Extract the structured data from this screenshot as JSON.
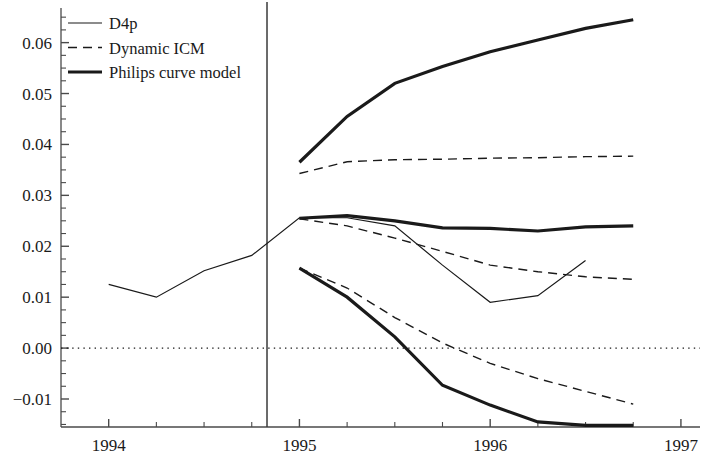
{
  "chart_data": {
    "type": "line",
    "title": "",
    "xlabel": "",
    "ylabel": "",
    "xlim": [
      1993.75,
      1997.1
    ],
    "ylim": [
      -0.0155,
      0.0668
    ],
    "yticks": [
      -0.01,
      0.0,
      0.01,
      0.02,
      0.03,
      0.04,
      0.05,
      0.06
    ],
    "ytick_labels": [
      "-0.01",
      "0.00",
      "0.01",
      "0.02",
      "0.03",
      "0.04",
      "0.05",
      "0.06"
    ],
    "y_minor_tick_step": 0.0025,
    "xticks": [
      1994,
      1995,
      1996,
      1997
    ],
    "xtick_labels": [
      "1994",
      "1995",
      "1996",
      "1997"
    ],
    "x_minor_tick_step": 0.25,
    "grid": false,
    "zero_line": {
      "value": 0.0,
      "style": "dotted"
    },
    "forecast_divider": {
      "x": 1994.83,
      "style": "solid",
      "label": ""
    },
    "legend": {
      "position": "top-left",
      "entries": [
        {
          "label": "D4p",
          "style": "solid",
          "width": 1.2
        },
        {
          "label": "Dynamic ICM",
          "style": "dashed",
          "width": 1.4
        },
        {
          "label": "Philips curve model",
          "style": "solid",
          "width": 3.2
        }
      ]
    },
    "series": [
      {
        "name": "D4p",
        "style": "solid",
        "width": 1.2,
        "x": [
          1994.0,
          1994.25,
          1994.5,
          1994.75,
          1995.0,
          1995.25,
          1995.5,
          1995.75,
          1996.0,
          1996.25,
          1996.5
        ],
        "values": [
          0.0125,
          0.01,
          0.0152,
          0.0182,
          0.0256,
          0.0256,
          0.024,
          0.0163,
          0.009,
          0.0103,
          0.0172
        ]
      },
      {
        "name": "Dynamic ICM (upper)",
        "style": "dashed",
        "width": 1.4,
        "x": [
          1995.0,
          1995.25,
          1995.5,
          1995.75,
          1996.0,
          1996.25,
          1996.5,
          1996.75
        ],
        "values": [
          0.0343,
          0.0366,
          0.037,
          0.0371,
          0.0373,
          0.0374,
          0.0376,
          0.0377
        ]
      },
      {
        "name": "Dynamic ICM (middle)",
        "style": "dashed",
        "width": 1.4,
        "x": [
          1995.0,
          1995.25,
          1995.5,
          1995.75,
          1996.0,
          1996.25,
          1996.5,
          1996.75
        ],
        "values": [
          0.0254,
          0.024,
          0.0216,
          0.019,
          0.0163,
          0.015,
          0.014,
          0.0135
        ]
      },
      {
        "name": "Dynamic ICM (lower)",
        "style": "dashed",
        "width": 1.4,
        "x": [
          1995.0,
          1995.25,
          1995.5,
          1995.75,
          1996.0,
          1996.25,
          1996.5,
          1996.75
        ],
        "values": [
          0.0157,
          0.0118,
          0.006,
          0.001,
          -0.003,
          -0.006,
          -0.0085,
          -0.011
        ]
      },
      {
        "name": "Philips curve model (upper)",
        "style": "solid",
        "width": 3.2,
        "x": [
          1995.0,
          1995.25,
          1995.5,
          1995.75,
          1996.0,
          1996.25,
          1996.5,
          1996.75
        ],
        "values": [
          0.0365,
          0.0455,
          0.052,
          0.0553,
          0.0582,
          0.0605,
          0.0628,
          0.0645
        ]
      },
      {
        "name": "Philips curve model (middle)",
        "style": "solid",
        "width": 3.2,
        "x": [
          1995.0,
          1995.25,
          1995.5,
          1995.75,
          1996.0,
          1996.25,
          1996.5,
          1996.75
        ],
        "values": [
          0.0255,
          0.026,
          0.025,
          0.0236,
          0.0235,
          0.023,
          0.0238,
          0.024
        ]
      },
      {
        "name": "Philips curve model (lower)",
        "style": "solid",
        "width": 3.2,
        "x": [
          1995.0,
          1995.25,
          1995.5,
          1995.75,
          1996.0,
          1996.25,
          1996.5,
          1996.75
        ],
        "values": [
          0.0157,
          0.01,
          0.0022,
          -0.0073,
          -0.0112,
          -0.0145,
          -0.0152,
          -0.0152
        ]
      }
    ],
    "colors": {
      "line": "#1a1a1a",
      "axis": "#4a4a4a",
      "background": "#ffffff"
    }
  }
}
